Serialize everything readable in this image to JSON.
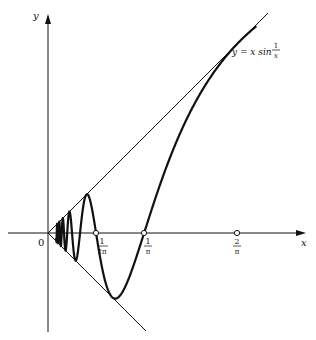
{
  "diagram": {
    "axes": {
      "x_label": "x",
      "y_label": "y",
      "origin_label": "0"
    },
    "curve_label": {
      "lhs": "y = x sin",
      "frac_num": "1",
      "frac_den": "x"
    },
    "ticks": [
      {
        "num": "1",
        "den": "2π",
        "value": 0.159
      },
      {
        "num": "1",
        "den": "π",
        "value": 0.318
      },
      {
        "num": "2",
        "den": "π",
        "value": 0.637
      }
    ],
    "lines": [
      "y = x",
      "y = -x"
    ],
    "colors": {
      "ink": "#111111",
      "background": "#ffffff"
    }
  }
}
